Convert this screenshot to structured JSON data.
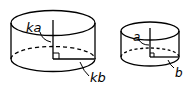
{
  "diagram": {
    "large_cylinder": {
      "height_label": "ka",
      "radius_label": "kb"
    },
    "small_cylinder": {
      "height_label": "a",
      "radius_label": "b"
    },
    "colors": {
      "stroke": "#000000",
      "background": "#ffffff"
    }
  }
}
